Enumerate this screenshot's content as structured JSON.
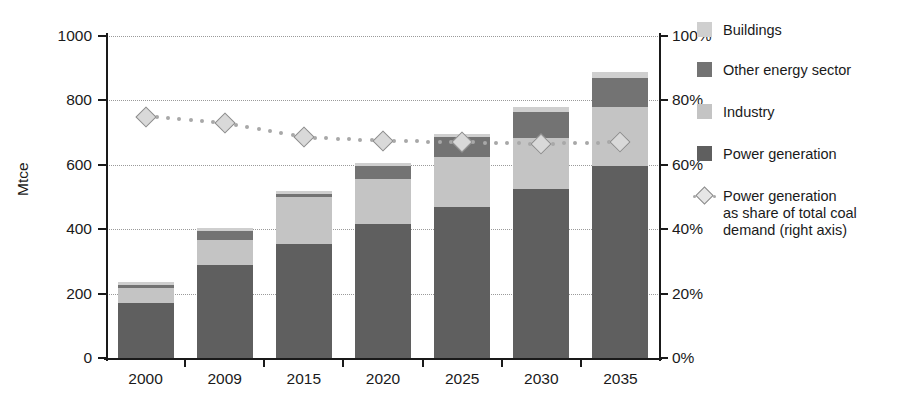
{
  "chart_data": {
    "type": "bar",
    "stacked": true,
    "title": "",
    "xlabel": "",
    "ylabel": "Mtce",
    "ylabel_right": "",
    "categories": [
      "2000",
      "2009",
      "2015",
      "2020",
      "2025",
      "2030",
      "2035"
    ],
    "ylim": [
      0,
      1000
    ],
    "yticks": [
      0,
      200,
      400,
      600,
      800,
      1000
    ],
    "ytick_labels": [
      "0",
      "200",
      "400",
      "600",
      "800",
      "1000"
    ],
    "ylim_right": [
      0,
      100
    ],
    "yticks_right": [
      0,
      20,
      40,
      60,
      80,
      100
    ],
    "ytick_labels_right": [
      "0%",
      "20%",
      "40%",
      "60%",
      "80%",
      "100%"
    ],
    "grid": true,
    "legend_position": "right",
    "series": [
      {
        "name": "Power generation",
        "color": "#5f5f5f",
        "values": [
          172,
          290,
          355,
          415,
          470,
          525,
          595
        ]
      },
      {
        "name": "Industry",
        "color": "#c4c4c4",
        "values": [
          45,
          75,
          145,
          140,
          155,
          158,
          185
        ]
      },
      {
        "name": "Other energy sector",
        "color": "#737373",
        "values": [
          10,
          30,
          10,
          40,
          60,
          82,
          90
        ]
      },
      {
        "name": "Buildings",
        "color": "#cfcfcf",
        "values": [
          8,
          10,
          10,
          10,
          12,
          15,
          17
        ]
      }
    ],
    "line_series": {
      "name": "Power generation\nas share of total coal\ndemand (right axis)",
      "axis": "right",
      "color": "#a8a8a8",
      "marker": "diamond",
      "marker_fill": "#d9d9d9",
      "style": "dotted",
      "values": [
        75,
        73,
        68.5,
        67.5,
        67,
        66.5,
        67
      ],
      "value_labels": [
        "75%",
        "73%",
        "68%",
        "67%",
        "67%",
        "66%",
        "67%"
      ]
    },
    "legend_entries": [
      {
        "label": "Buildings",
        "color": "#cfcfcf",
        "kind": "swatch"
      },
      {
        "label": "Other energy sector",
        "color": "#737373",
        "kind": "swatch"
      },
      {
        "label": "Industry",
        "color": "#c4c4c4",
        "kind": "swatch"
      },
      {
        "label": "Power generation",
        "color": "#5f5f5f",
        "kind": "swatch"
      },
      {
        "label": "Power generation\nas share of total coal\ndemand (right axis)",
        "color": "#a8a8a8",
        "kind": "line-marker"
      }
    ]
  }
}
